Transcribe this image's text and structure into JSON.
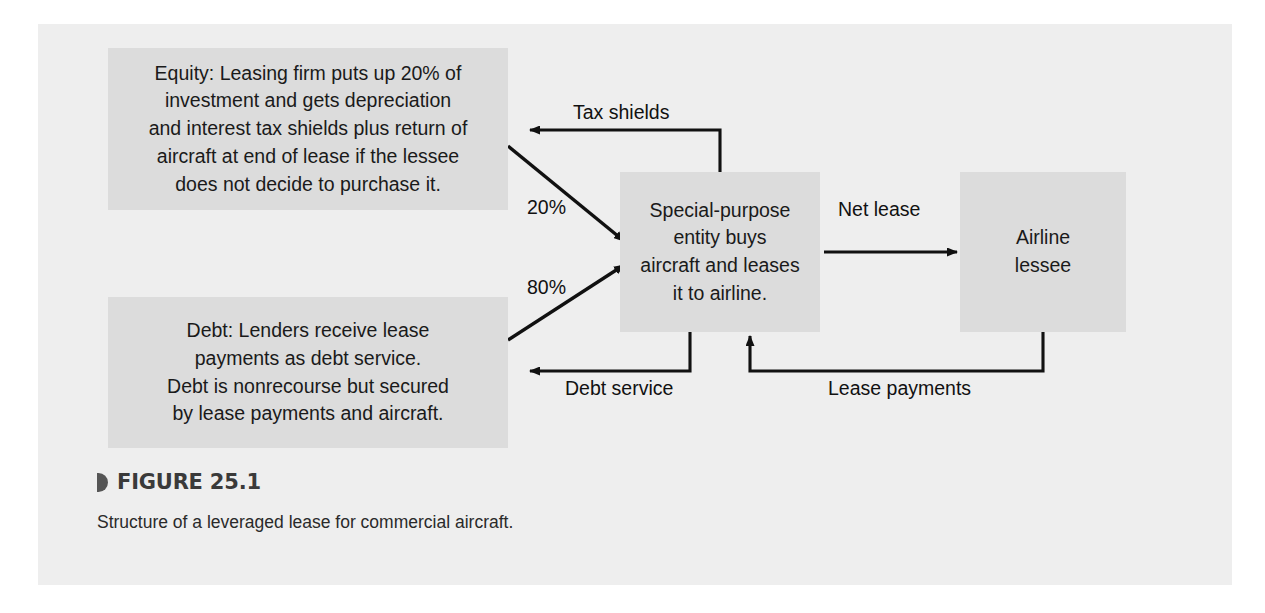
{
  "figure": {
    "number_label": "FIGURE 25.1",
    "caption": "Structure of a leveraged lease for commercial aircraft.",
    "bullet_icon": "triangle-bullet-icon"
  },
  "nodes": {
    "equity": {
      "name": "equity-box",
      "text": "Equity: Leasing firm puts up 20% of\ninvestment and gets depreciation\nand interest tax shields plus return of\naircraft at end of lease if the lessee\ndoes not decide to purchase it."
    },
    "debt": {
      "name": "debt-box",
      "text": "Debt: Lenders receive lease\npayments as debt service.\nDebt is nonrecourse but secured\nby lease payments and aircraft."
    },
    "spe": {
      "name": "special-purpose-entity-box",
      "text": "Special-purpose\nentity buys\naircraft and leases\nit to airline."
    },
    "airline": {
      "name": "airline-lessee-box",
      "text": "Airline\nlessee"
    }
  },
  "edges": {
    "tax_shields": "Tax shields",
    "equity_share": "20%",
    "debt_share": "80%",
    "net_lease": "Net lease",
    "debt_service": "Debt service",
    "lease_payments": "Lease payments"
  },
  "colors": {
    "panel_background": "#eeeeee",
    "box_fill": "#dcdcdc",
    "line": "#111111",
    "text": "#1a1a1a",
    "heading": "#3a3a3a"
  }
}
